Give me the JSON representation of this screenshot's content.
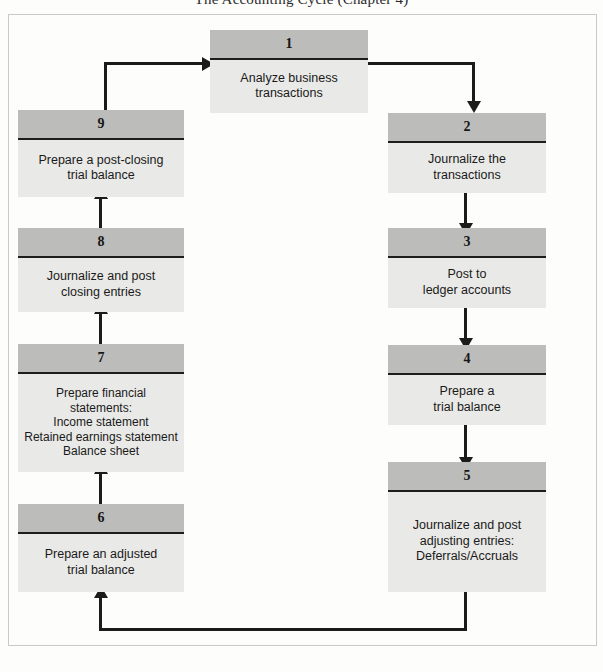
{
  "header": {
    "caption": "The Accounting Cycle (Chapter 4)"
  },
  "diagram": {
    "colors": {
      "node_header_fill": "#bcbcba",
      "node_body_fill": "#e9e9e7",
      "rule": "#1d1d1d",
      "connector": "#1b1b1b",
      "page_frame": "#c9c9c6"
    },
    "nodes": [
      {
        "number": "1",
        "lines": [
          "Analyze business",
          "transactions"
        ]
      },
      {
        "number": "2",
        "lines": [
          "Journalize the",
          "transactions"
        ]
      },
      {
        "number": "3",
        "lines": [
          "Post to",
          "ledger accounts"
        ]
      },
      {
        "number": "4",
        "lines": [
          "Prepare a",
          "trial balance"
        ]
      },
      {
        "number": "5",
        "lines": [
          "Journalize and post",
          "adjusting entries:",
          "Deferrals/Accruals"
        ]
      },
      {
        "number": "6",
        "lines": [
          "Prepare an adjusted",
          "trial balance"
        ]
      },
      {
        "number": "7",
        "lines": [
          "Prepare financial",
          "statements:",
          "Income statement",
          "Retained earnings statement",
          "Balance sheet"
        ]
      },
      {
        "number": "8",
        "lines": [
          "Journalize and post",
          "closing entries"
        ]
      },
      {
        "number": "9",
        "lines": [
          "Prepare a post-closing",
          "trial balance"
        ]
      }
    ],
    "connectors": [
      {
        "from": "9",
        "to": "1",
        "direction": "right"
      },
      {
        "from": "1",
        "to": "2",
        "direction": "down"
      },
      {
        "from": "2",
        "to": "3",
        "direction": "down"
      },
      {
        "from": "3",
        "to": "4",
        "direction": "down"
      },
      {
        "from": "4",
        "to": "5",
        "direction": "down"
      },
      {
        "from": "5",
        "to": "6",
        "direction": "up"
      },
      {
        "from": "6",
        "to": "7",
        "direction": "up"
      },
      {
        "from": "7",
        "to": "8",
        "direction": "up"
      },
      {
        "from": "8",
        "to": "9",
        "direction": "up"
      }
    ]
  }
}
